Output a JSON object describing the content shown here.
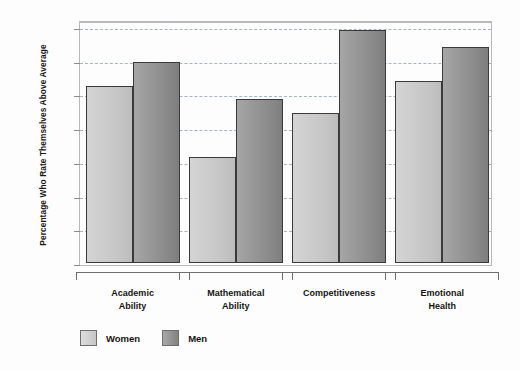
{
  "chart_data": {
    "type": "bar",
    "title": "",
    "subtitle": "",
    "xlabel": "",
    "ylabel": "Percentage Who Rate Themselves Above Average",
    "ylim": [
      0,
      70
    ],
    "yticks": [
      0,
      10,
      20,
      30,
      40,
      50,
      60,
      70
    ],
    "ytick_labels": [
      "0",
      "10",
      "20",
      "30",
      "40",
      "50",
      "60",
      "70"
    ],
    "grid": true,
    "grid_axis": "y",
    "legend_position": "bottom-left",
    "categories": [
      "Academic\nAbility",
      "Mathematical\nAbility",
      "Competitiveness",
      "Emotional\nHealth"
    ],
    "category_lines": [
      [
        "Academic",
        "Ability"
      ],
      [
        "Mathematical",
        "Ability"
      ],
      [
        "Competitiveness"
      ],
      [
        "Emotional",
        "Health"
      ]
    ],
    "series": [
      {
        "name": "Women",
        "color": "#c8c8c8",
        "values": [
          52.5,
          31.5,
          44.5,
          54.0
        ]
      },
      {
        "name": "Men",
        "color": "#8c8c8c",
        "values": [
          59.5,
          48.5,
          69.0,
          64.0
        ]
      }
    ]
  },
  "legend": {
    "items": [
      {
        "label": "Women",
        "swatch": "women"
      },
      {
        "label": "Men",
        "swatch": "men"
      }
    ]
  },
  "colors": {
    "women_bar": "#c8c8c8",
    "men_bar": "#8c8c8c",
    "bar_outline": "#3a3a3a",
    "gridline": "#9aa7b5",
    "plot_border": "#b9b9b9",
    "background": "#fdfdfd",
    "text": "#141414"
  }
}
